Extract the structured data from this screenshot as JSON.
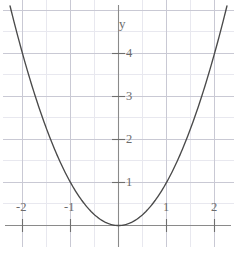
{
  "chart_data": {
    "type": "line",
    "title": "",
    "subtitle": "",
    "xlabel": "",
    "ylabel": "y",
    "function": "y = x^2",
    "xlim": [
      -2.45,
      2.45
    ],
    "ylim": [
      -0.42,
      5.2
    ],
    "grid": true,
    "grid_major_step_x": 1,
    "grid_major_step_y": 1,
    "grid_minor_step_x": 0.5,
    "grid_minor_step_y": 0.5,
    "legend": "none",
    "x_tick_labels": [
      "-2",
      "-1",
      "1",
      "2"
    ],
    "x_tick_values": [
      -2,
      -1,
      1,
      2
    ],
    "y_tick_labels": [
      "1",
      "2",
      "3",
      "4"
    ],
    "y_tick_values": [
      1,
      2,
      3,
      4
    ],
    "axis_label_y": "y",
    "vertex": [
      0,
      0
    ],
    "series": [
      {
        "name": "y = x^2",
        "color": "#4a4a4a",
        "x": [
          -2.28,
          -2.1,
          -1.9,
          -1.7,
          -1.5,
          -1.3,
          -1.1,
          -0.9,
          -0.7,
          -0.5,
          -0.3,
          -0.1,
          0,
          0.1,
          0.3,
          0.5,
          0.7,
          0.9,
          1.1,
          1.3,
          1.5,
          1.7,
          1.9,
          2.1,
          2.28
        ],
        "y": [
          5.2,
          4.41,
          3.61,
          2.89,
          2.25,
          1.69,
          1.21,
          0.81,
          0.49,
          0.25,
          0.09,
          0.01,
          0,
          0.01,
          0.09,
          0.25,
          0.49,
          0.81,
          1.21,
          1.69,
          2.25,
          2.89,
          3.61,
          4.41,
          5.2
        ]
      }
    ],
    "colors": {
      "curve": "#4a4a4a",
      "axis": "#8a8a8a",
      "grid_major": "#c9c9d4",
      "grid_minor": "#e4e4ec",
      "tick_text": "#6b6b6b"
    }
  },
  "labels": {
    "x_neg2": "-2",
    "x_neg1": "-1",
    "x_pos1": "1",
    "x_pos2": "2",
    "y_1": "1",
    "y_2": "2",
    "y_3": "3",
    "y_4": "4",
    "y_axis": "y"
  }
}
